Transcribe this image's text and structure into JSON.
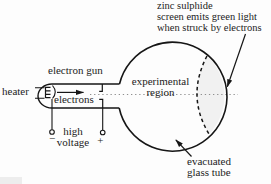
{
  "labels": {
    "screen_note": {
      "l1": "zinc sulphide",
      "l2": "screen emits green light",
      "l3": "when struck by electrons"
    },
    "electron_gun": "electron gun",
    "heater": "heater",
    "electrons": "electrons",
    "experimental_region": {
      "l1": "experimental",
      "l2": "region"
    },
    "high_voltage": {
      "l1": "high",
      "l2": "voltage"
    },
    "tube_note": {
      "l1": "evacuated",
      "l2": "glass tube"
    },
    "terminal_negative": "−",
    "terminal_positive": "+"
  },
  "icons": {
    "electron_direction": "arrow-right",
    "screen_pointer": "arrow-down-left",
    "tube_pointer": "arrow-up-left"
  },
  "colors": {
    "ink": "#1c1c1c",
    "line": "#161616",
    "beam_dots": "#8f8f8f",
    "screen_tint": "#f1f1f1",
    "background": "#fdfdfd",
    "artifact": "#ededed"
  }
}
